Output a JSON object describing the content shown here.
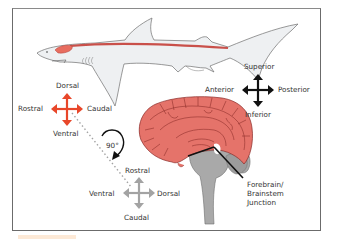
{
  "figure": {
    "shark_axes": {
      "dorsal": "Dorsal",
      "rostral": "Rostral",
      "caudal": "Caudal",
      "ventral": "Ventral",
      "color": "#e8472a"
    },
    "human_axes": {
      "superior": "Superior",
      "anterior": "Anterior",
      "posterior": "Posterior",
      "inferior": "Inferior",
      "color": "#111111"
    },
    "rotated_axes": {
      "rostral": "Rostral",
      "ventral": "Ventral",
      "dorsal": "Dorsal",
      "caudal": "Caudal",
      "color": "#a3a3a3"
    },
    "rotation": {
      "label": "90°"
    },
    "callout": {
      "line1": "Forebrain/",
      "line2": "Brainstem",
      "line3": "Junction"
    },
    "colors": {
      "brain": "#e5736a",
      "brain_outline": "#8a2a26",
      "brainstem": "#a9a9a9",
      "shark_body": "#eef0f2",
      "shark_cord": "#c9504a",
      "frame": "#6b6b6b"
    }
  }
}
